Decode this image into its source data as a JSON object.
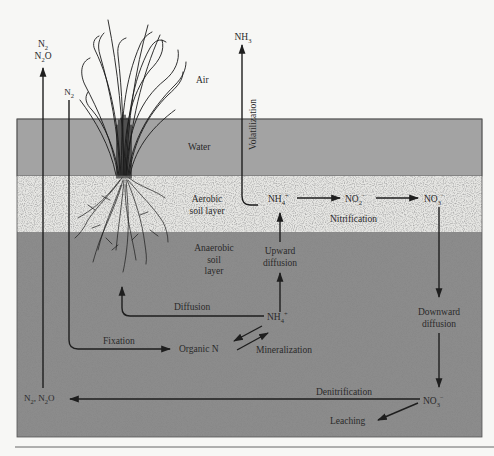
{
  "diagram": {
    "layers": {
      "air": "Air",
      "water": "Water",
      "aerobic": [
        "Aerobic",
        "soil layer"
      ],
      "anaerobic": [
        "Anaerobic",
        "soil",
        "layer"
      ]
    },
    "colors": {
      "background": "#f7f7f5",
      "water": "#a3a3a3",
      "aerobic": "#e6e6e3",
      "anaerobic": "#8c8c8c",
      "line": "#1e1e1e"
    },
    "species": {
      "n2_top": "N",
      "n2_top_sub": "2",
      "n2o_top": "N",
      "n2o_top_sub": "2",
      "n2o_top_suffix": "O",
      "n2_fix": "N",
      "n2_fix_sub": "2",
      "nh3": "NH",
      "nh3_sub": "3",
      "nh4_aerobic": "NH",
      "nh4_aerobic_sub": "4",
      "nh4_aerobic_sup": "+",
      "no2": "NO",
      "no2_sub": "2",
      "no2_sup": "−",
      "no3_aerobic": "NO",
      "no3_aerobic_sub": "3",
      "no3_aerobic_sup": "−",
      "nh4_anaerobic": "NH",
      "nh4_anaerobic_sub": "4",
      "nh4_anaerobic_sup": "+",
      "organic_n": "Organic N",
      "no3_bottom": "NO",
      "no3_bottom_sub": "3",
      "no3_bottom_sup": "−",
      "n2_n2o_bottom_a": "N",
      "n2_n2o_bottom_a_sub": "2",
      "n2_n2o_bottom_sep": ", N",
      "n2_n2o_bottom_b_sub": "2",
      "n2_n2o_bottom_suffix": "O"
    },
    "processes": {
      "volatilization": "Volatilization",
      "nitrification": "Nitrification",
      "upward_diffusion": [
        "Upward",
        "diffusion"
      ],
      "diffusion": "Diffusion",
      "fixation": "Fixation",
      "mineralization": "Mineralization",
      "downward_diffusion": [
        "Downward",
        "diffusion"
      ],
      "denitrification": "Denitrification",
      "leaching": "Leaching"
    }
  }
}
